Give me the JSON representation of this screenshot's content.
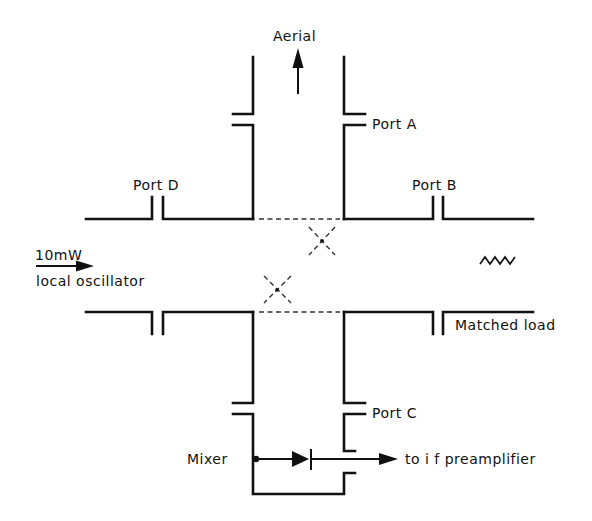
{
  "diagram": {
    "type": "waveguide directional coupler mixer schematic",
    "labels": {
      "aerial": "Aerial",
      "port_a": "Port A",
      "port_b": "Port B",
      "port_c": "Port C",
      "port_d": "Port D",
      "lo_power": "10mW",
      "lo_name": "local oscillator",
      "matched_load": "Matched load",
      "mixer": "Mixer",
      "output": "to i f preamplifier"
    },
    "components": [
      {
        "id": "main-guide",
        "kind": "vertical waveguide",
        "ports": [
          "Port A",
          "Port C"
        ]
      },
      {
        "id": "aux-guide",
        "kind": "horizontal waveguide",
        "ports": [
          "Port D",
          "Port B"
        ]
      },
      {
        "id": "coupling-holes",
        "kind": "crossed-guide coupling apertures",
        "count": 2
      },
      {
        "id": "load",
        "kind": "matched load (resistor)",
        "at": "Port B side"
      },
      {
        "id": "diode",
        "kind": "mixer diode",
        "at": "Port C"
      }
    ],
    "colors": {
      "ink": "#111111",
      "background": "#ffffff"
    }
  }
}
